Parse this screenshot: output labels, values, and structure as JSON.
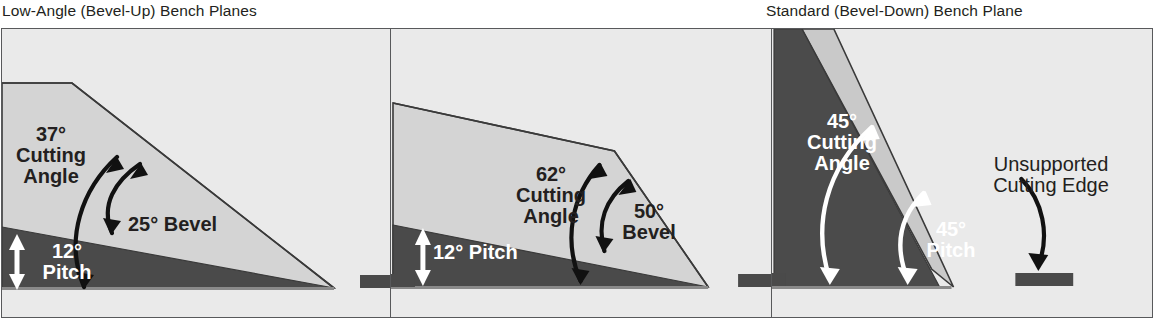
{
  "figure": {
    "type": "technical-diagram",
    "captions": {
      "left": "Low-Angle (Bevel-Up) Bench Planes",
      "right": "Standard (Bevel-Down) Bench Plane"
    },
    "colors": {
      "background": "#eaeaea",
      "page": "#ffffff",
      "frame_stroke": "#58595b",
      "blade_light": "#d4d4d4",
      "blade_mid": "#c2c2c2",
      "bed_dark": "#4a4a4a",
      "frog_dark": "#4b4b4b",
      "text_dark": "#231f20",
      "text_light": "#ffffff"
    }
  },
  "panels": [
    {
      "id": "panel-1",
      "name": "low-angle-25-bevel",
      "orientation": "bevel-up",
      "labels": [
        {
          "name": "cutting-angle-label",
          "lines": [
            "37°",
            "Cutting",
            "Angle"
          ],
          "color": "dark",
          "value": 37,
          "unit": "degrees"
        },
        {
          "name": "bevel-label",
          "lines": [
            "25° Bevel"
          ],
          "color": "dark",
          "value": 25,
          "unit": "degrees"
        },
        {
          "name": "pitch-label",
          "lines": [
            "12°",
            "Pitch"
          ],
          "color": "white",
          "value": 12,
          "unit": "degrees"
        }
      ]
    },
    {
      "id": "panel-2",
      "name": "low-angle-50-bevel",
      "orientation": "bevel-up",
      "labels": [
        {
          "name": "cutting-angle-label",
          "lines": [
            "62°",
            "Cutting",
            "Angle"
          ],
          "color": "dark",
          "value": 62,
          "unit": "degrees"
        },
        {
          "name": "bevel-label",
          "lines": [
            "50°",
            "Bevel"
          ],
          "color": "dark",
          "value": 50,
          "unit": "degrees"
        },
        {
          "name": "pitch-label",
          "lines": [
            "12° Pitch"
          ],
          "color": "white",
          "value": 12,
          "unit": "degrees"
        }
      ]
    },
    {
      "id": "panel-3",
      "name": "standard-bevel-down",
      "orientation": "bevel-down",
      "labels": [
        {
          "name": "cutting-angle-label",
          "lines": [
            "45°",
            "Cutting",
            "Angle"
          ],
          "color": "white",
          "value": 45,
          "unit": "degrees"
        },
        {
          "name": "pitch-label",
          "lines": [
            "45°",
            "Pitch"
          ],
          "color": "white",
          "value": 45,
          "unit": "degrees"
        },
        {
          "name": "unsupported-edge-label",
          "lines": [
            "Unsupported",
            "Cutting Edge"
          ],
          "color": "dark"
        }
      ]
    }
  ],
  "text": {
    "p1_cut_l1": "37°",
    "p1_cut_l2": "Cutting",
    "p1_cut_l3": "Angle",
    "p1_bevel": "25° Bevel",
    "p1_pitch_l1": "12°",
    "p1_pitch_l2": "Pitch",
    "p2_cut_l1": "62°",
    "p2_cut_l2": "Cutting",
    "p2_cut_l3": "Angle",
    "p2_bevel_l1": "50°",
    "p2_bevel_l2": "Bevel",
    "p2_pitch": "12° Pitch",
    "p3_cut_l1": "45°",
    "p3_cut_l2": "Cutting",
    "p3_cut_l3": "Angle",
    "p3_pitch_l1": "45°",
    "p3_pitch_l2": "Pitch",
    "p3_unsup_l1": "Unsupported",
    "p3_unsup_l2": "Cutting Edge"
  }
}
